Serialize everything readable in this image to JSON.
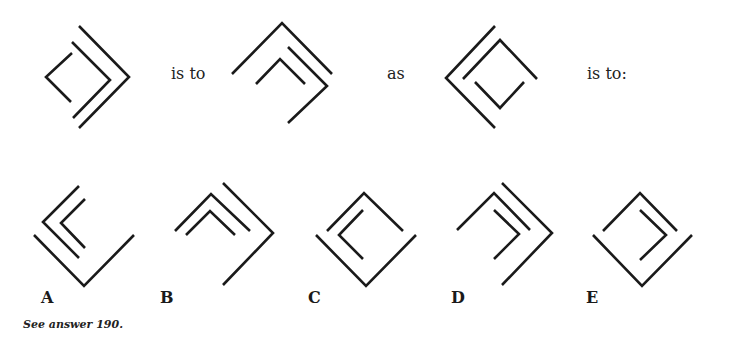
{
  "puzzle": {
    "connectors": {
      "is_to_1": "is to",
      "as": "as",
      "is_to_2": "is to:"
    },
    "figures": {
      "prompt": [
        {
          "id": "fig-1",
          "description": "small left-pointing chevron inside a right-pointing double chevron"
        },
        {
          "id": "fig-2",
          "description": "large up chevron over small up chevron, with right-pointing chevron at right"
        },
        {
          "id": "fig-3",
          "description": "large left chevron enclosing up chevron above small down chevron"
        }
      ],
      "options": [
        {
          "label": "A",
          "description": "left double chevron above down chevron"
        },
        {
          "label": "B",
          "description": "up double chevron with right chevron"
        },
        {
          "label": "C",
          "description": "up chevron, small left chevron, down chevron forming a diamond"
        },
        {
          "label": "D",
          "description": "up chevron, small right chevron, large right chevron"
        },
        {
          "label": "E",
          "description": "up chevron, small right chevron, down chevron forming a diamond"
        }
      ]
    },
    "footer": "See answer 190."
  }
}
